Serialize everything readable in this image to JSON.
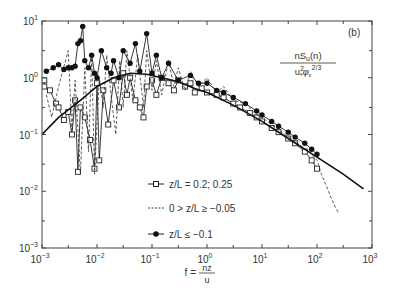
{
  "chart_data": {
    "type": "line",
    "panel_label": "(b)",
    "title": "",
    "ylabel": "nS_u(n) / (u*^2 φ_ε^(2/3))",
    "ylabel_parts": {
      "numerator": "nS",
      "num_sub": "u",
      "num_tail": "(n)",
      "den_main": "u",
      "den_sup": "2",
      "den_sub": "*",
      "den_phi": "φ",
      "den_phi_sub": "ε",
      "den_exp": "2/3"
    },
    "xlabel": "f = nz/u",
    "xlabel_parts": {
      "lhs": "f =",
      "num": "nz",
      "den": "u"
    },
    "xscale": "log",
    "yscale": "log",
    "xlim": [
      0.001,
      1000
    ],
    "ylim": [
      0.001,
      10
    ],
    "x_ticks": [
      {
        "base": "10",
        "exp": "−3",
        "value": 0.001
      },
      {
        "base": "10",
        "exp": "−2",
        "value": 0.01
      },
      {
        "base": "10",
        "exp": "−1",
        "value": 0.1
      },
      {
        "base": "10",
        "exp": "0",
        "value": 1
      },
      {
        "base": "10",
        "exp": "1",
        "value": 10
      },
      {
        "base": "10",
        "exp": "2",
        "value": 100
      },
      {
        "base": "10",
        "exp": "3",
        "value": 1000
      }
    ],
    "y_ticks": [
      {
        "base": "10",
        "exp": "−3",
        "value": 0.001
      },
      {
        "base": "10",
        "exp": "−2",
        "value": 0.01
      },
      {
        "base": "10",
        "exp": "−1",
        "value": 0.1
      },
      {
        "base": "10",
        "exp": "0",
        "value": 1
      },
      {
        "base": "10",
        "exp": "1",
        "value": 10
      }
    ],
    "grid": false,
    "legend_position": "center-left inside plot",
    "series": [
      {
        "name": "z/L = 0.2; 0.25",
        "marker": "open-square",
        "line": "solid",
        "points": [
          [
            0.0011,
            0.9
          ],
          [
            0.0011,
            0.7
          ],
          [
            0.0014,
            0.6
          ],
          [
            0.0018,
            0.35
          ],
          [
            0.002,
            0.3
          ],
          [
            0.0025,
            0.18
          ],
          [
            0.003,
            0.25
          ],
          [
            0.0035,
            0.1
          ],
          [
            0.004,
            0.4
          ],
          [
            0.0045,
            0.022
          ],
          [
            0.005,
            0.3
          ],
          [
            0.006,
            0.2
          ],
          [
            0.0075,
            0.08
          ],
          [
            0.009,
            0.025
          ],
          [
            0.01,
            0.8
          ],
          [
            0.011,
            0.035
          ],
          [
            0.013,
            0.6
          ],
          [
            0.016,
            0.15
          ],
          [
            0.02,
            0.9
          ],
          [
            0.025,
            0.3
          ],
          [
            0.03,
            1.2
          ],
          [
            0.035,
            0.5
          ],
          [
            0.04,
            1.0
          ],
          [
            0.05,
            0.4
          ],
          [
            0.06,
            0.3
          ],
          [
            0.07,
            0.2
          ],
          [
            0.08,
            0.7
          ],
          [
            0.1,
            0.9
          ],
          [
            0.12,
            0.5
          ],
          [
            0.15,
            1.0
          ],
          [
            0.2,
            0.8
          ],
          [
            0.25,
            0.6
          ],
          [
            0.3,
            0.9
          ],
          [
            0.4,
            0.7
          ],
          [
            0.5,
            0.8
          ],
          [
            0.6,
            0.55
          ],
          [
            0.8,
            0.65
          ],
          [
            1,
            0.55
          ],
          [
            1.5,
            0.5
          ],
          [
            2,
            0.45
          ],
          [
            3,
            0.35
          ],
          [
            4,
            0.3
          ],
          [
            6,
            0.24
          ],
          [
            8,
            0.2
          ],
          [
            10,
            0.17
          ],
          [
            15,
            0.13
          ],
          [
            20,
            0.11
          ],
          [
            30,
            0.085
          ],
          [
            40,
            0.07
          ],
          [
            60,
            0.05
          ],
          [
            80,
            0.035
          ],
          [
            100,
            0.025
          ]
        ]
      },
      {
        "name": "0 > z/L ≥ −0.05",
        "marker": "none",
        "line": "dashed",
        "points": [
          [
            0.0012,
            0.5
          ],
          [
            0.0015,
            0.2
          ],
          [
            0.002,
            0.7
          ],
          [
            0.003,
            3.0
          ],
          [
            0.0035,
            0.12
          ],
          [
            0.004,
            0.9
          ],
          [
            0.005,
            0.02
          ],
          [
            0.006,
            1.5
          ],
          [
            0.007,
            0.05
          ],
          [
            0.008,
            2.5
          ],
          [
            0.009,
            0.02
          ],
          [
            0.011,
            1.0
          ],
          [
            0.013,
            0.3
          ],
          [
            0.015,
            2.5
          ],
          [
            0.018,
            0.5
          ],
          [
            0.022,
            0.1
          ],
          [
            0.026,
            2.0
          ],
          [
            0.03,
            0.3
          ],
          [
            0.035,
            3.0
          ],
          [
            0.045,
            0.4
          ],
          [
            0.055,
            2.5
          ],
          [
            0.07,
            0.3
          ],
          [
            0.08,
            3.0
          ],
          [
            0.1,
            0.6
          ],
          [
            0.12,
            2.0
          ],
          [
            0.15,
            0.5
          ],
          [
            0.2,
            2.0
          ],
          [
            0.25,
            0.7
          ],
          [
            0.3,
            1.5
          ],
          [
            0.4,
            0.6
          ],
          [
            0.5,
            1.3
          ],
          [
            0.7,
            0.7
          ],
          [
            1,
            1.0
          ],
          [
            1.5,
            0.55
          ],
          [
            2,
            0.7
          ],
          [
            3,
            0.4
          ],
          [
            5,
            0.35
          ],
          [
            8,
            0.22
          ],
          [
            10,
            0.2
          ],
          [
            20,
            0.12
          ],
          [
            40,
            0.075
          ],
          [
            70,
            0.05
          ],
          [
            100,
            0.035
          ],
          [
            120,
            0.02
          ],
          [
            150,
            0.012
          ],
          [
            200,
            0.006
          ],
          [
            250,
            0.004
          ]
        ]
      },
      {
        "name": "z/L ≤ −0.1",
        "marker": "filled-circle",
        "line": "solid",
        "points": [
          [
            0.0012,
            1.3
          ],
          [
            0.0016,
            1.5
          ],
          [
            0.002,
            1.7
          ],
          [
            0.0025,
            1.4
          ],
          [
            0.003,
            1.5
          ],
          [
            0.0035,
            1.5
          ],
          [
            0.004,
            1.6
          ],
          [
            0.0045,
            4.0
          ],
          [
            0.005,
            4.5
          ],
          [
            0.0055,
            8.0
          ],
          [
            0.006,
            2.0
          ],
          [
            0.007,
            1.5
          ],
          [
            0.008,
            2.5
          ],
          [
            0.009,
            1.2
          ],
          [
            0.01,
            1.0
          ],
          [
            0.012,
            3.0
          ],
          [
            0.015,
            1.5
          ],
          [
            0.018,
            1.2
          ],
          [
            0.02,
            2.0
          ],
          [
            0.025,
            1.0
          ],
          [
            0.03,
            3.0
          ],
          [
            0.04,
            1.8
          ],
          [
            0.05,
            4.0
          ],
          [
            0.06,
            1.3
          ],
          [
            0.08,
            6.0
          ],
          [
            0.1,
            1.2
          ],
          [
            0.12,
            2.5
          ],
          [
            0.15,
            1.0
          ],
          [
            0.2,
            1.8
          ],
          [
            0.3,
            0.9
          ],
          [
            0.5,
            1.1
          ],
          [
            0.7,
            0.8
          ],
          [
            1,
            0.8
          ],
          [
            1.5,
            0.6
          ],
          [
            2,
            0.55
          ],
          [
            3,
            0.45
          ],
          [
            5,
            0.35
          ],
          [
            8,
            0.26
          ],
          [
            10,
            0.22
          ],
          [
            15,
            0.17
          ],
          [
            20,
            0.14
          ],
          [
            30,
            0.11
          ],
          [
            40,
            0.09
          ],
          [
            60,
            0.07
          ],
          [
            80,
            0.055
          ],
          [
            100,
            0.045
          ]
        ]
      },
      {
        "name": "reference curve",
        "marker": "none",
        "line": "solid-thick",
        "points": [
          [
            0.001,
            0.1
          ],
          [
            0.002,
            0.2
          ],
          [
            0.005,
            0.4
          ],
          [
            0.01,
            0.7
          ],
          [
            0.02,
            1.0
          ],
          [
            0.04,
            1.2
          ],
          [
            0.08,
            1.15
          ],
          [
            0.15,
            1.0
          ],
          [
            0.3,
            0.85
          ],
          [
            0.6,
            0.65
          ],
          [
            1,
            0.55
          ],
          [
            3,
            0.33
          ],
          [
            10,
            0.17
          ],
          [
            30,
            0.085
          ],
          [
            100,
            0.04
          ],
          [
            300,
            0.02
          ],
          [
            700,
            0.011
          ]
        ]
      }
    ]
  }
}
